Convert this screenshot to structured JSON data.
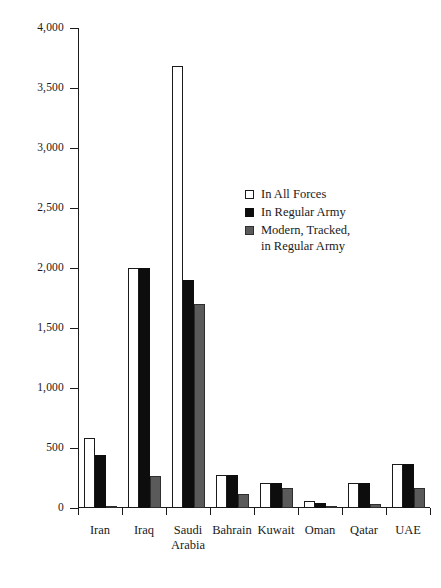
{
  "chart_data": {
    "type": "bar",
    "title": "",
    "subtitle": "",
    "xlabel": "",
    "ylabel": "",
    "ylim": [
      0,
      4000
    ],
    "ytick_step": 500,
    "grid": false,
    "legend_position": "inside-upper-right",
    "categories": [
      "Iran",
      "Iraq",
      "Saudi Arabia",
      "Bahrain",
      "Kuwait",
      "Oman",
      "Qatar",
      "UAE"
    ],
    "category_lines": [
      [
        "Iran"
      ],
      [
        "Iraq"
      ],
      [
        "Saudi",
        "Arabia"
      ],
      [
        "Bahrain"
      ],
      [
        "Kuwait"
      ],
      [
        "Oman"
      ],
      [
        "Qatar"
      ],
      [
        "UAE"
      ]
    ],
    "ytick_labels": [
      "0",
      "500",
      "1,000",
      "1,500",
      "2,000",
      "2,500",
      "3,000",
      "3,500",
      "4,000"
    ],
    "ytick_values": [
      0,
      500,
      1000,
      1500,
      2000,
      2500,
      3000,
      3500,
      4000
    ],
    "series": [
      {
        "name": "In All Forces",
        "color": "#ffffff",
        "edge_color": "#1a1a1a",
        "values": [
          580,
          2000,
          3680,
          275,
          210,
          60,
          210,
          370
        ]
      },
      {
        "name": "In Regular Army",
        "color": "#0d0d0d",
        "edge_color": "#0d0d0d",
        "values": [
          440,
          2000,
          1900,
          275,
          210,
          40,
          210,
          370
        ]
      },
      {
        "name": "Modern, Tracked, in Regular Army",
        "color": "#5a5a5a",
        "edge_color": "#2e2e2e",
        "values": [
          20,
          270,
          1700,
          120,
          170,
          10,
          30,
          170
        ]
      }
    ],
    "legend_entries": [
      {
        "label": "In All Forces",
        "label_lines": [
          "In All Forces"
        ],
        "swatch": "white-square"
      },
      {
        "label": "In Regular Army",
        "label_lines": [
          "In Regular Army"
        ],
        "swatch": "black-square"
      },
      {
        "label": "Modern, Tracked, in Regular Army",
        "label_lines": [
          "Modern, Tracked,",
          "in Regular Army"
        ],
        "swatch": "gray-square"
      }
    ]
  }
}
